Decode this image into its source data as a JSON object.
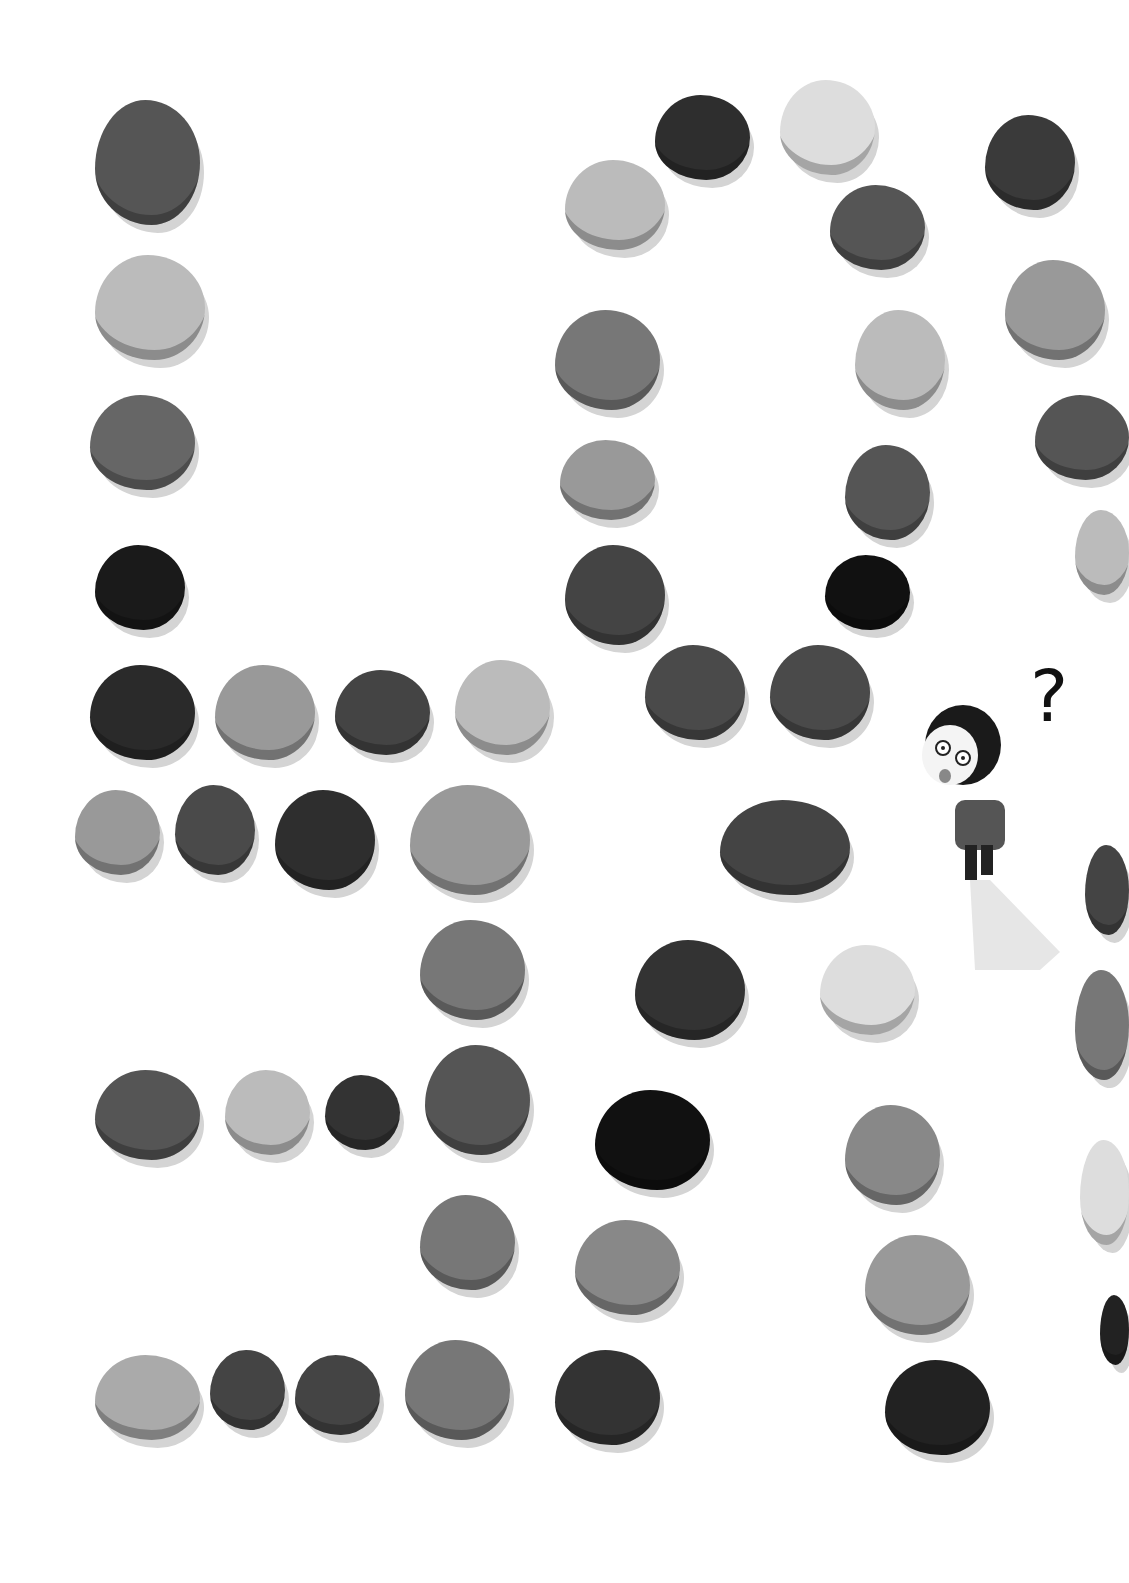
{
  "illustration": {
    "description": "Hand-drawn stones arranged on white paper forming letter-like shapes, with a small surprised character and a question mark",
    "question_mark": "?",
    "stones": [
      {
        "x": 95,
        "y": 100,
        "w": 105,
        "h": 125,
        "c": "#555"
      },
      {
        "x": 95,
        "y": 255,
        "w": 110,
        "h": 105,
        "c": "#bbb"
      },
      {
        "x": 90,
        "y": 395,
        "w": 105,
        "h": 95,
        "c": "#666"
      },
      {
        "x": 95,
        "y": 545,
        "w": 90,
        "h": 85,
        "c": "#1a1a1a"
      },
      {
        "x": 90,
        "y": 665,
        "w": 105,
        "h": 95,
        "c": "#2a2a2a"
      },
      {
        "x": 215,
        "y": 665,
        "w": 100,
        "h": 95,
        "c": "#999"
      },
      {
        "x": 335,
        "y": 670,
        "w": 95,
        "h": 85,
        "c": "#444"
      },
      {
        "x": 455,
        "y": 660,
        "w": 95,
        "h": 95,
        "c": "#bbb"
      },
      {
        "x": 75,
        "y": 790,
        "w": 85,
        "h": 85,
        "c": "#999"
      },
      {
        "x": 175,
        "y": 785,
        "w": 80,
        "h": 90,
        "c": "#4a4a4a"
      },
      {
        "x": 275,
        "y": 790,
        "w": 100,
        "h": 100,
        "c": "#2e2e2e"
      },
      {
        "x": 410,
        "y": 785,
        "w": 120,
        "h": 110,
        "c": "#999"
      },
      {
        "x": 420,
        "y": 920,
        "w": 105,
        "h": 100,
        "c": "#777"
      },
      {
        "x": 95,
        "y": 1070,
        "w": 105,
        "h": 90,
        "c": "#555"
      },
      {
        "x": 225,
        "y": 1070,
        "w": 85,
        "h": 85,
        "c": "#bbb"
      },
      {
        "x": 325,
        "y": 1075,
        "w": 75,
        "h": 75,
        "c": "#333"
      },
      {
        "x": 425,
        "y": 1045,
        "w": 105,
        "h": 110,
        "c": "#555"
      },
      {
        "x": 420,
        "y": 1195,
        "w": 95,
        "h": 95,
        "c": "#777"
      },
      {
        "x": 95,
        "y": 1355,
        "w": 105,
        "h": 85,
        "c": "#aaa"
      },
      {
        "x": 210,
        "y": 1350,
        "w": 75,
        "h": 80,
        "c": "#444"
      },
      {
        "x": 295,
        "y": 1355,
        "w": 85,
        "h": 80,
        "c": "#444"
      },
      {
        "x": 405,
        "y": 1340,
        "w": 105,
        "h": 100,
        "c": "#777"
      },
      {
        "x": 555,
        "y": 1350,
        "w": 105,
        "h": 95,
        "c": "#333"
      },
      {
        "x": 565,
        "y": 160,
        "w": 100,
        "h": 90,
        "c": "#bbb"
      },
      {
        "x": 655,
        "y": 95,
        "w": 95,
        "h": 85,
        "c": "#2e2e2e"
      },
      {
        "x": 780,
        "y": 80,
        "w": 95,
        "h": 95,
        "c": "#ddd"
      },
      {
        "x": 830,
        "y": 185,
        "w": 95,
        "h": 85,
        "c": "#555"
      },
      {
        "x": 555,
        "y": 310,
        "w": 105,
        "h": 100,
        "c": "#777"
      },
      {
        "x": 855,
        "y": 310,
        "w": 90,
        "h": 100,
        "c": "#bbb"
      },
      {
        "x": 560,
        "y": 440,
        "w": 95,
        "h": 80,
        "c": "#999"
      },
      {
        "x": 845,
        "y": 445,
        "w": 85,
        "h": 95,
        "c": "#555"
      },
      {
        "x": 565,
        "y": 545,
        "w": 100,
        "h": 100,
        "c": "#444"
      },
      {
        "x": 825,
        "y": 555,
        "w": 85,
        "h": 75,
        "c": "#111"
      },
      {
        "x": 645,
        "y": 645,
        "w": 100,
        "h": 95,
        "c": "#4a4a4a"
      },
      {
        "x": 770,
        "y": 645,
        "w": 100,
        "h": 95,
        "c": "#4a4a4a"
      },
      {
        "x": 720,
        "y": 800,
        "w": 130,
        "h": 95,
        "c": "#444"
      },
      {
        "x": 635,
        "y": 940,
        "w": 110,
        "h": 100,
        "c": "#333"
      },
      {
        "x": 820,
        "y": 945,
        "w": 95,
        "h": 90,
        "c": "#ddd"
      },
      {
        "x": 595,
        "y": 1090,
        "w": 115,
        "h": 100,
        "c": "#111"
      },
      {
        "x": 845,
        "y": 1105,
        "w": 95,
        "h": 100,
        "c": "#888"
      },
      {
        "x": 575,
        "y": 1220,
        "w": 105,
        "h": 95,
        "c": "#888"
      },
      {
        "x": 865,
        "y": 1235,
        "w": 105,
        "h": 100,
        "c": "#999"
      },
      {
        "x": 885,
        "y": 1360,
        "w": 105,
        "h": 95,
        "c": "#222"
      },
      {
        "x": 985,
        "y": 115,
        "w": 90,
        "h": 95,
        "c": "#3a3a3a"
      },
      {
        "x": 1005,
        "y": 260,
        "w": 100,
        "h": 100,
        "c": "#999"
      },
      {
        "x": 1035,
        "y": 395,
        "w": 94,
        "h": 85,
        "c": "#555"
      },
      {
        "x": 1075,
        "y": 510,
        "w": 54,
        "h": 85,
        "c": "#bbb"
      },
      {
        "x": 1085,
        "y": 845,
        "w": 44,
        "h": 90,
        "c": "#444"
      },
      {
        "x": 1075,
        "y": 970,
        "w": 54,
        "h": 110,
        "c": "#777"
      },
      {
        "x": 1080,
        "y": 1140,
        "w": 49,
        "h": 105,
        "c": "#ddd"
      },
      {
        "x": 1100,
        "y": 1295,
        "w": 29,
        "h": 70,
        "c": "#222"
      }
    ]
  }
}
